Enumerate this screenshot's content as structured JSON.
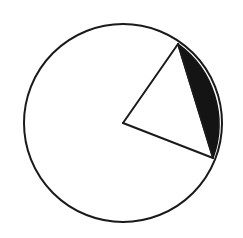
{
  "canvas": {
    "width": 243,
    "height": 238,
    "background_color": "#ffffff"
  },
  "figure": {
    "name": "circle-with-shaded-segment",
    "stroke_color": "#1a1a1a",
    "fill_color": "#ffffff",
    "shaded_color": "#141414",
    "stroke_width": 2
  },
  "chart_data": {
    "type": "diagram",
    "title": "",
    "shapes": [
      {
        "name": "circle",
        "type": "circle",
        "center_x": 123,
        "center_y": 123,
        "radius": 99,
        "fill": "#ffffff",
        "stroke": "#1a1a1a",
        "stroke_width": 2
      },
      {
        "name": "radius-upper",
        "type": "line",
        "x1": 123,
        "y1": 123,
        "x2": 178,
        "y2": 44,
        "stroke": "#1a1a1a",
        "stroke_width": 2
      },
      {
        "name": "radius-lower",
        "type": "line",
        "x1": 123,
        "y1": 123,
        "x2": 213,
        "y2": 158,
        "stroke": "#1a1a1a",
        "stroke_width": 2
      },
      {
        "name": "chord",
        "type": "line",
        "x1": 178,
        "y1": 44,
        "x2": 213,
        "y2": 158,
        "stroke": "#1a1a1a",
        "stroke_width": 2
      },
      {
        "name": "shaded-segment",
        "type": "circular-segment",
        "chord_start_x": 178,
        "chord_start_y": 44,
        "chord_end_x": 213,
        "chord_end_y": 158,
        "arc_radius": 99,
        "arc_sweep": "clockwise-minor",
        "fill": "#141414"
      }
    ],
    "points": [
      {
        "name": "center",
        "x": 123,
        "y": 123,
        "label": ""
      },
      {
        "name": "chord-endpoint-upper",
        "x": 178,
        "y": 44,
        "label": ""
      },
      {
        "name": "chord-endpoint-lower",
        "x": 213,
        "y": 158,
        "label": ""
      }
    ],
    "annotations": [],
    "legend": [],
    "grid": false
  }
}
